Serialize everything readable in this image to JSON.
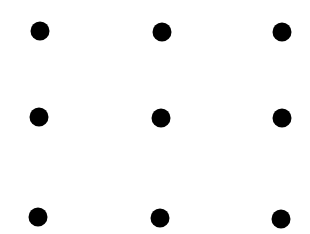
{
  "diagram": {
    "type": "dot-grid",
    "rows": 3,
    "cols": 3,
    "dot_color": "#000000",
    "background": "#ffffff",
    "dot_radius": 9.5,
    "dots": [
      {
        "row": 1,
        "col": 1,
        "cx": 40,
        "cy": 31
      },
      {
        "row": 1,
        "col": 2,
        "cx": 162,
        "cy": 32
      },
      {
        "row": 1,
        "col": 3,
        "cx": 282,
        "cy": 32
      },
      {
        "row": 2,
        "col": 1,
        "cx": 39,
        "cy": 117
      },
      {
        "row": 2,
        "col": 2,
        "cx": 161,
        "cy": 118
      },
      {
        "row": 2,
        "col": 3,
        "cx": 282,
        "cy": 118
      },
      {
        "row": 3,
        "col": 1,
        "cx": 38,
        "cy": 217
      },
      {
        "row": 3,
        "col": 2,
        "cx": 160,
        "cy": 218
      },
      {
        "row": 3,
        "col": 3,
        "cx": 281,
        "cy": 219
      }
    ]
  }
}
